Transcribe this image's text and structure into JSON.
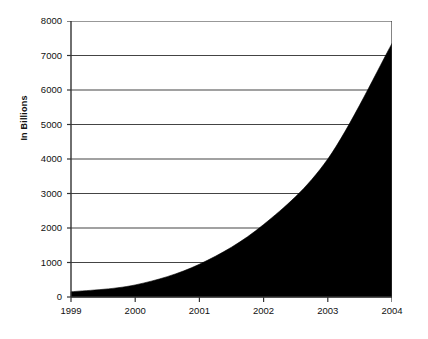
{
  "chart_data": {
    "type": "area",
    "title": "",
    "xlabel": "",
    "ylabel": "In Billions",
    "categories": [
      "1999",
      "2000",
      "2001",
      "2002",
      "2003",
      "2004"
    ],
    "x": [
      1999,
      2000,
      2001,
      2002,
      2003,
      2004
    ],
    "values": [
      150,
      350,
      950,
      2100,
      4000,
      7350
    ],
    "series": [
      {
        "name": "In Billions",
        "values": [
          150,
          350,
          950,
          2100,
          4000,
          7350
        ]
      }
    ],
    "ylim": [
      0,
      8000
    ],
    "xlim": [
      1999,
      2004
    ],
    "y_ticks": [
      0,
      1000,
      2000,
      3000,
      4000,
      5000,
      6000,
      7000,
      8000
    ],
    "y_tick_labels": [
      "0",
      "1000",
      "2000",
      "3000",
      "4000",
      "5000",
      "6000",
      "7000",
      "8000"
    ],
    "x_tick_labels": [
      "1999",
      "2000",
      "2001",
      "2002",
      "2003",
      "2004"
    ],
    "grid": "horizontal",
    "legend": "none",
    "fill_color": "#000000",
    "axis_color": "#333333",
    "grid_color": "#444444",
    "background_color": "#ffffff"
  }
}
